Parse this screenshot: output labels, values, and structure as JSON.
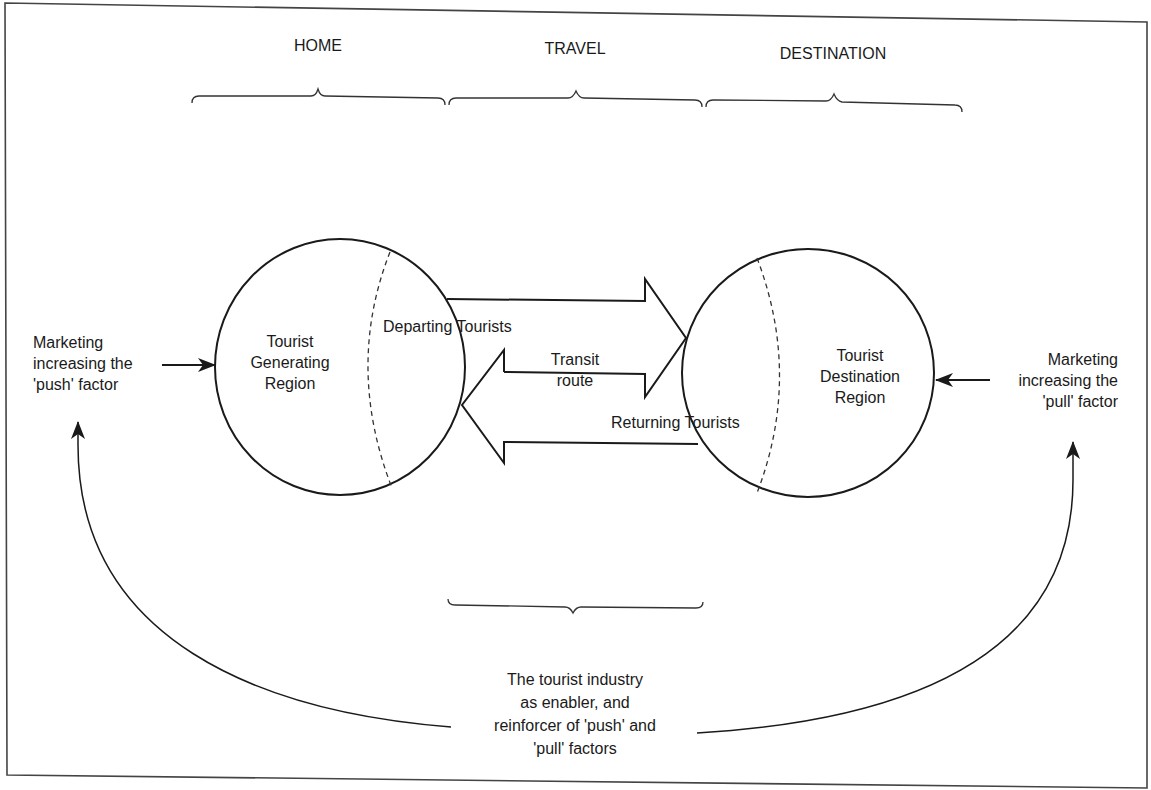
{
  "diagram": {
    "type": "tourism-system-flow-diagram",
    "stages": [
      {
        "id": "home",
        "label": "HOME"
      },
      {
        "id": "travel",
        "label": "TRAVEL"
      },
      {
        "id": "destination",
        "label": "DESTINATION"
      }
    ],
    "regions": {
      "generating": {
        "lines": [
          "Tourist",
          "Generating",
          "Region"
        ]
      },
      "destination": {
        "lines": [
          "Tourist",
          "Destination",
          "Region"
        ]
      }
    },
    "flows": {
      "departing": "Departing Tourists",
      "transit": {
        "lines": [
          "Transit",
          "route"
        ]
      },
      "returning": "Returning Tourists"
    },
    "marketing": {
      "push": {
        "lines": [
          "Marketing",
          "increasing the",
          "'push' factor"
        ]
      },
      "pull": {
        "lines": [
          "Marketing",
          "increasing the",
          "'pull' factor"
        ]
      }
    },
    "industry": {
      "lines": [
        "The tourist industry",
        "as enabler, and",
        "reinforcer of 'push' and",
        "'pull' factors"
      ]
    },
    "colors": {
      "stroke": "#1a1a1a",
      "frame": "#444444",
      "background": "#ffffff"
    }
  }
}
